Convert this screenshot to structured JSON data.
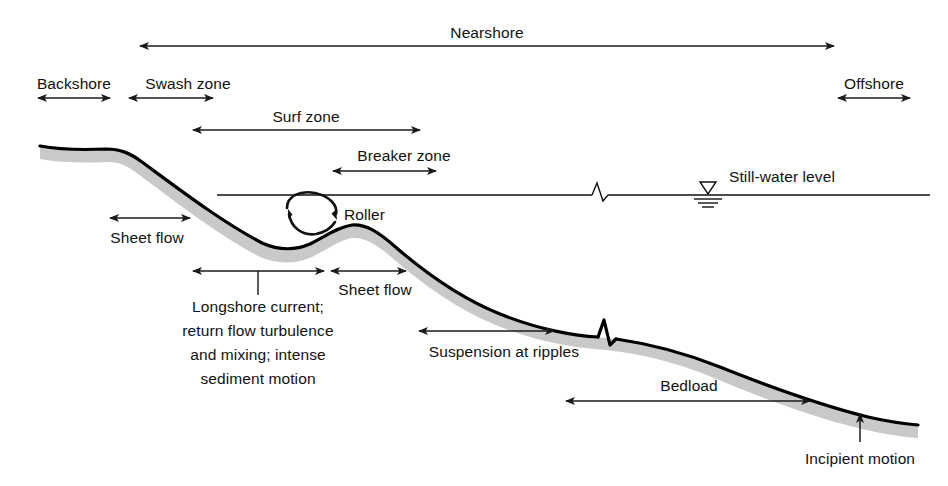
{
  "figure": {
    "colors": {
      "line": "#111111",
      "sand": "#c9c9c9",
      "background": "#ffffff",
      "profile_stroke": "#000000"
    }
  },
  "zone_labels": {
    "nearshore": "Nearshore",
    "backshore": "Backshore",
    "swash_zone": "Swash zone",
    "offshore": "Offshore",
    "surf_zone": "Surf zone",
    "breaker_zone": "Breaker zone"
  },
  "process_labels": {
    "roller": "Roller",
    "sheet_flow_upper": "Sheet flow",
    "sheet_flow_lower": "Sheet flow",
    "longshore": {
      "line1": "Longshore current;",
      "line2": "return flow turbulence",
      "line3": "and mixing; intense",
      "line4": "sediment motion"
    },
    "suspension": "Suspension at ripples",
    "bedload": "Bedload",
    "incipient_motion": "Incipient motion"
  },
  "water": {
    "still_water_level": "Still-water level"
  },
  "icons": {
    "water_level": "water-level-symbol",
    "break_mark_water": "break-symbol",
    "break_mark_bed": "break-symbol",
    "roller_circulation": "circular-arrow-icon"
  }
}
